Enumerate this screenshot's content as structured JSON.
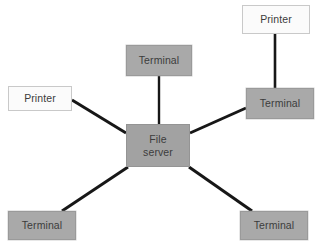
{
  "diagram": {
    "canvas": {
      "width": 318,
      "height": 244,
      "background": "#ffffff"
    },
    "palette": {
      "terminal_fill": "#a9a9a9",
      "terminal_border": "#9a9a9a",
      "printer_fill": "#fbfbfb",
      "printer_border": "#c9c9c9",
      "server_fill": "#a2a2a2",
      "server_border": "#949494",
      "edge_color": "#171717",
      "text_color": "#3c3c3c"
    },
    "nodes": [
      {
        "id": "printer-top-right",
        "type": "printer",
        "label": "Printer",
        "x": 242,
        "y": 5,
        "w": 68,
        "h": 29
      },
      {
        "id": "terminal-top-center",
        "type": "terminal",
        "label": "Terminal",
        "x": 126,
        "y": 45,
        "w": 66,
        "h": 31
      },
      {
        "id": "terminal-right",
        "type": "terminal",
        "label": "Terminal",
        "x": 246,
        "y": 88,
        "w": 68,
        "h": 31
      },
      {
        "id": "printer-left",
        "type": "printer",
        "label": "Printer",
        "x": 8,
        "y": 86,
        "w": 64,
        "h": 25
      },
      {
        "id": "file-server",
        "type": "server",
        "label": "File\nserver",
        "x": 126,
        "y": 124,
        "w": 64,
        "h": 43
      },
      {
        "id": "terminal-bottom-left",
        "type": "terminal",
        "label": "Terminal",
        "x": 8,
        "y": 211,
        "w": 68,
        "h": 29
      },
      {
        "id": "terminal-bottom-right",
        "type": "terminal",
        "label": "Terminal",
        "x": 240,
        "y": 211,
        "w": 68,
        "h": 29
      }
    ],
    "edges": [
      {
        "id": "edge-printer-top-right-to-terminal-right",
        "from": "printer-top-right",
        "to": "terminal-right",
        "x1": 275,
        "y1": 34,
        "x2": 275,
        "y2": 88,
        "width": 2.6
      },
      {
        "id": "edge-terminal-top-center-to-file-server",
        "from": "terminal-top-center",
        "to": "file-server",
        "x1": 159,
        "y1": 76,
        "x2": 159,
        "y2": 124,
        "width": 2.4
      },
      {
        "id": "edge-terminal-right-to-file-server",
        "from": "terminal-right",
        "to": "file-server",
        "x1": 246,
        "y1": 108,
        "x2": 190,
        "y2": 133,
        "width": 3.0
      },
      {
        "id": "edge-printer-left-to-file-server",
        "from": "printer-left",
        "to": "file-server",
        "x1": 72,
        "y1": 100,
        "x2": 126,
        "y2": 133,
        "width": 3.0
      },
      {
        "id": "edge-terminal-bottom-left-to-file-server",
        "from": "terminal-bottom-left",
        "to": "file-server",
        "x1": 62,
        "y1": 211,
        "x2": 128,
        "y2": 167,
        "width": 3.0
      },
      {
        "id": "edge-terminal-bottom-right-to-file-server",
        "from": "terminal-bottom-right",
        "to": "file-server",
        "x1": 252,
        "y1": 211,
        "x2": 189,
        "y2": 167,
        "width": 3.0
      }
    ]
  }
}
